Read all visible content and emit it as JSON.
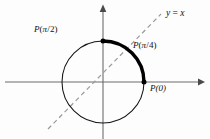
{
  "figure": {
    "background_color": "#fdfdfd",
    "stroke_color": "#101010",
    "axis_color": "#6d6d6d",
    "dash_color": "#9a9a9a",
    "arc_color": "#000000"
  },
  "geometry": {
    "center_x": 103,
    "center_y": 82,
    "radius": 41,
    "x_axis_from": 5,
    "x_axis_to": 203,
    "y_axis_from": 5,
    "y_axis_to": 139,
    "dashed_line_from": [
      48,
      129
    ],
    "dashed_line_to": [
      161,
      14
    ],
    "arc_start_angle_deg": 0,
    "arc_end_angle_deg": 90
  },
  "labels": {
    "p_half": {
      "fn": "P",
      "open": "(",
      "num": "π",
      "slash": "/",
      "den": "2",
      "close": ")"
    },
    "p_quarter": {
      "fn": "P",
      "open": "(",
      "num": "π",
      "slash": "/",
      "den": "4",
      "close": ")"
    },
    "p_zero": {
      "text": "P(0)"
    },
    "line_equation": {
      "lhs": "y",
      "eq": "=",
      "rhs": "x"
    }
  },
  "points": [
    {
      "name": "point-p-pi-over-2",
      "x": 103,
      "y": 41
    },
    {
      "name": "point-p-0",
      "x": 144,
      "y": 82
    }
  ]
}
